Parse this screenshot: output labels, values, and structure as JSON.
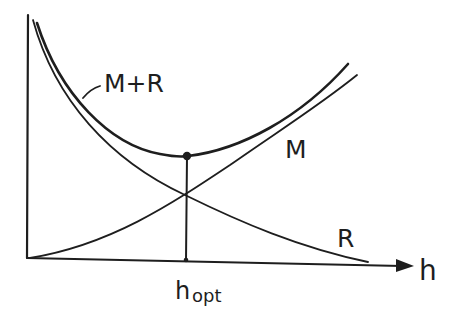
{
  "diagram": {
    "type": "cost-tradeoff-curves",
    "axes": {
      "x_label": "h",
      "y_label": ""
    },
    "curves": [
      {
        "name": "M+R",
        "label": "M+R",
        "shape": "u-shaped",
        "description": "sum of M and R"
      },
      {
        "name": "M",
        "label": "M",
        "shape": "increasing"
      },
      {
        "name": "R",
        "label": "R",
        "shape": "decreasing"
      }
    ],
    "optimum": {
      "label_main": "h",
      "label_sub": "opt",
      "marker": "dot at minimum of M+R with vertical line to h-axis"
    },
    "stroke_color": "#1e1e1e",
    "background_color": "#ffffff"
  }
}
